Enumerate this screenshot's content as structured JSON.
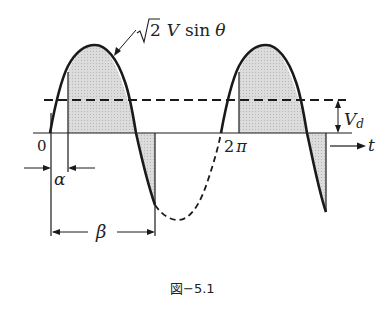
{
  "figure": {
    "caption": "図−5.1",
    "curve_label_sqrt": "√",
    "curve_label_two": "2",
    "curve_label_V": "V",
    "curve_label_sin": "sin",
    "curve_label_theta": "θ",
    "origin_label": "0",
    "two_pi_label": "2π",
    "two_pi_num": "2",
    "two_pi_sym": "π",
    "axis_label": "t",
    "alpha_label": "α",
    "beta_label": "β",
    "vd_label": "V",
    "vd_sub": "d",
    "colors": {
      "line": "#1a1a1a",
      "shade": "#d4d4d4",
      "background": "#ffffff"
    }
  }
}
